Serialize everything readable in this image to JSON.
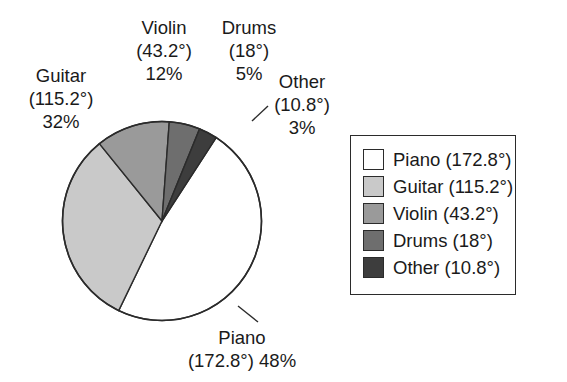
{
  "chart_data": {
    "type": "pie",
    "title": "",
    "categories": [
      "Piano",
      "Guitar",
      "Violin",
      "Drums",
      "Other"
    ],
    "values": [
      48,
      32,
      12,
      5,
      3
    ],
    "value_unit": "%",
    "angles_deg": [
      172.8,
      115.2,
      43.2,
      18,
      10.8
    ],
    "slice_colors": [
      "#ffffff",
      "#c9c9c9",
      "#9a9a9a",
      "#6e6e6e",
      "#3d3d3d"
    ],
    "legend_position": "right",
    "grid": false,
    "start_angle_deg": -57,
    "direction": "clockwise",
    "slices": [
      {
        "name": "Piano",
        "angle_label": "(172.8°)",
        "percent_label": "48%",
        "angle_deg": 172.8,
        "percent": 48,
        "color": "#ffffff"
      },
      {
        "name": "Guitar",
        "angle_label": "(115.2°)",
        "percent_label": "32%",
        "angle_deg": 115.2,
        "percent": 32,
        "color": "#c9c9c9"
      },
      {
        "name": "Violin",
        "angle_label": "(43.2°)",
        "percent_label": "12%",
        "angle_deg": 43.2,
        "percent": 12,
        "color": "#9a9a9a"
      },
      {
        "name": "Drums",
        "angle_label": "(18°)",
        "percent_label": "5%",
        "angle_deg": 18,
        "percent": 5,
        "color": "#6e6e6e"
      },
      {
        "name": "Other",
        "angle_label": "(10.8°)",
        "percent_label": "3%",
        "angle_deg": 10.8,
        "percent": 3,
        "color": "#3d3d3d"
      }
    ]
  },
  "callouts": {
    "guitar": {
      "name": "Guitar",
      "angle": "(115.2°)",
      "percent": "32%"
    },
    "violin": {
      "name": "Violin",
      "angle": "(43.2°)",
      "percent": "12%"
    },
    "drums": {
      "name": "Drums",
      "angle": "(18°)",
      "percent": "5%"
    },
    "other": {
      "name": "Other",
      "angle": "(10.8°)",
      "percent": "3%"
    },
    "piano": {
      "name": "Piano",
      "angle_percent": "(172.8°) 48%"
    }
  },
  "legend": {
    "items": [
      {
        "label": "Piano (172.8°)",
        "color": "#ffffff"
      },
      {
        "label": "Guitar (115.2°)",
        "color": "#c9c9c9"
      },
      {
        "label": "Violin (43.2°)",
        "color": "#9a9a9a"
      },
      {
        "label": "Drums (18°)",
        "color": "#6e6e6e"
      },
      {
        "label": "Other (10.8°)",
        "color": "#3d3d3d"
      }
    ]
  },
  "style": {
    "outline_color": "#2b2b2b",
    "text_color": "#1a1a1a",
    "background": "#ffffff"
  }
}
